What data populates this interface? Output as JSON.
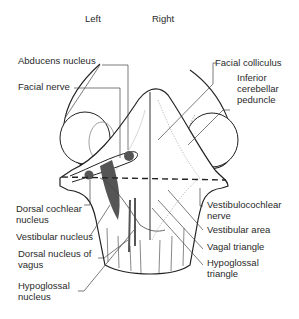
{
  "orientation": {
    "left": "Left",
    "right": "Right"
  },
  "labels": {
    "abducens_nucleus": "Abducens nucleus",
    "facial_nerve": "Facial nerve",
    "facial_colliculus": "Facial colliculus",
    "inferior_cerebellar_peduncle": [
      "Inferior",
      "cerebellar",
      "peduncle"
    ],
    "dorsal_cochlear_nucleus": [
      "Dorsal cochlear",
      "nucleus"
    ],
    "vestibular_nucleus": "Vestibular nucleus",
    "dorsal_nucleus_of_vagus": [
      "Dorsal nucleus of",
      "vagus"
    ],
    "hypoglossal_nucleus": [
      "Hypoglossal",
      "nucleus"
    ],
    "vestibulocochlear_nerve": [
      "Vestibulocochlear",
      "nerve"
    ],
    "vestibular_area": "Vestibular area",
    "vagal_triangle": "Vagal triangle",
    "hypoglossal_triangle": [
      "Hypoglossal",
      "triangle"
    ]
  },
  "colors": {
    "line": "#222222",
    "nucleus_fill": "#555555",
    "leader": "#444444"
  }
}
